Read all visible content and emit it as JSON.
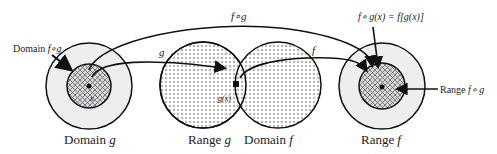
{
  "diagram": {
    "type": "function-composition",
    "labels": {
      "composite_arrow": "f∘g",
      "g_arrow": "g",
      "f_arrow": "f",
      "domain_fog_prefix": "Domain ",
      "domain_fog_func": "f∘g",
      "formula": "f∘ g(x) = f[g(x)]",
      "range_fog_prefix": "Range ",
      "range_fog_func": "f∘ g",
      "domain_g_prefix": "Domain ",
      "domain_g_func": "g",
      "range_g_prefix": "Range ",
      "range_g_func": "g",
      "domain_f_prefix": "Domain ",
      "domain_f_func": "f",
      "range_f_prefix": "Range",
      "range_f_func": "f",
      "x_point": "x",
      "gx_point": "g(x)"
    },
    "colors": {
      "stroke": "#111111",
      "outer_fill": "#eeeeee",
      "dot_pattern": "#555555"
    }
  }
}
